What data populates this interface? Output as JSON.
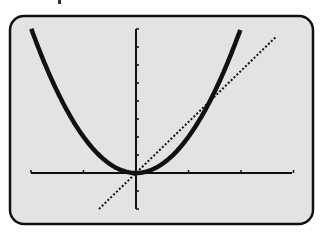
{
  "screen": {
    "background": "#e3e3e3",
    "frame_color": "#111111",
    "curve_color": "#111111"
  },
  "chart_data": {
    "type": "line",
    "title": "",
    "xlabel": "",
    "ylabel": "",
    "grid": false,
    "legend": null,
    "xlim": [
      -2.85,
      4.3
    ],
    "ylim": [
      -2,
      8
    ],
    "x_tick_spacing_px": 52.5,
    "y_tick_step": 1,
    "series": [
      {
        "name": "parabola",
        "equation": "y = x^2",
        "style": "thick solid",
        "x": [
          -2.83,
          -2,
          -1,
          0,
          1,
          2,
          2.83
        ],
        "y": [
          8,
          4,
          1,
          0,
          1,
          4,
          8
        ]
      },
      {
        "name": "line",
        "equation": "y = 2x",
        "style": "dotted",
        "x": [
          -1,
          0,
          1,
          2,
          3.8
        ],
        "y": [
          -2,
          0,
          2,
          4,
          7.6
        ]
      }
    ],
    "intersections": [
      {
        "x": 0,
        "y": 0
      },
      {
        "x": 2,
        "y": 4
      }
    ]
  }
}
